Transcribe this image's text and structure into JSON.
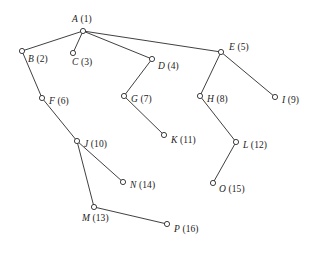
{
  "diagram": {
    "type": "tree-graph",
    "background_color": "#ffffff",
    "stroke_color": "#2a2a2a",
    "node_fill_color": "#ffffff",
    "node_radius": 2.6,
    "canvas": {
      "width": 320,
      "height": 254
    },
    "nodes": [
      {
        "id": "A",
        "letter": "A",
        "number": "(1)",
        "label": "A (1)",
        "x": 83,
        "y": 31,
        "label_dx": -11,
        "label_dy": -16
      },
      {
        "id": "B",
        "letter": "B",
        "number": "(2)",
        "label": "B (2)",
        "x": 22,
        "y": 51,
        "label_dx": 6,
        "label_dy": 4
      },
      {
        "id": "C",
        "letter": "C",
        "number": "(3)",
        "label": "C (3)",
        "x": 73,
        "y": 53,
        "label_dx": -1,
        "label_dy": 5
      },
      {
        "id": "D",
        "letter": "D",
        "number": "(4)",
        "label": "D (4)",
        "x": 152,
        "y": 59,
        "label_dx": 6,
        "label_dy": 3
      },
      {
        "id": "E",
        "letter": "E",
        "number": "(5)",
        "label": "E (5)",
        "x": 221,
        "y": 52,
        "label_dx": 8,
        "label_dy": -9
      },
      {
        "id": "F",
        "letter": "F",
        "number": "(6)",
        "label": "F (6)",
        "x": 42,
        "y": 98,
        "label_dx": 7,
        "label_dy": -1
      },
      {
        "id": "G",
        "letter": "G",
        "number": "(7)",
        "label": "G (7)",
        "x": 124,
        "y": 96,
        "label_dx": 7,
        "label_dy": -1
      },
      {
        "id": "H",
        "letter": "H",
        "number": "(8)",
        "label": "H (8)",
        "x": 200,
        "y": 96,
        "label_dx": 7,
        "label_dy": -1
      },
      {
        "id": "I",
        "letter": "I",
        "number": "(9)",
        "label": "I (9)",
        "x": 275,
        "y": 97,
        "label_dx": 7,
        "label_dy": -1
      },
      {
        "id": "J",
        "letter": "J",
        "number": "(10)",
        "label": "J (10)",
        "x": 77,
        "y": 141,
        "label_dx": 7,
        "label_dy": -1
      },
      {
        "id": "K",
        "letter": "K",
        "number": "(11)",
        "label": "K (11)",
        "x": 164,
        "y": 135,
        "label_dx": 7,
        "label_dy": 1
      },
      {
        "id": "L",
        "letter": "L",
        "number": "(12)",
        "label": "L (12)",
        "x": 236,
        "y": 142,
        "label_dx": 7,
        "label_dy": -1
      },
      {
        "id": "M",
        "letter": "M",
        "number": "(13)",
        "label": "M (13)",
        "x": 94,
        "y": 207,
        "label_dx": -12,
        "label_dy": 7
      },
      {
        "id": "N",
        "letter": "N",
        "number": "(14)",
        "label": "N (14)",
        "x": 123,
        "y": 182,
        "label_dx": 7,
        "label_dy": -1
      },
      {
        "id": "O",
        "letter": "O",
        "number": "(15)",
        "label": "O (15)",
        "x": 213,
        "y": 183,
        "label_dx": 6,
        "label_dy": 2
      },
      {
        "id": "P",
        "letter": "P",
        "number": "(16)",
        "label": "P (16)",
        "x": 167,
        "y": 224,
        "label_dx": 7,
        "label_dy": 1
      }
    ],
    "edges": [
      {
        "from": "A",
        "to": "B"
      },
      {
        "from": "A",
        "to": "C"
      },
      {
        "from": "A",
        "to": "D"
      },
      {
        "from": "A",
        "to": "E"
      },
      {
        "from": "B",
        "to": "F"
      },
      {
        "from": "D",
        "to": "G"
      },
      {
        "from": "E",
        "to": "H"
      },
      {
        "from": "E",
        "to": "I"
      },
      {
        "from": "F",
        "to": "J"
      },
      {
        "from": "G",
        "to": "K"
      },
      {
        "from": "H",
        "to": "L"
      },
      {
        "from": "J",
        "to": "M"
      },
      {
        "from": "J",
        "to": "N"
      },
      {
        "from": "L",
        "to": "O"
      },
      {
        "from": "M",
        "to": "P"
      }
    ]
  }
}
